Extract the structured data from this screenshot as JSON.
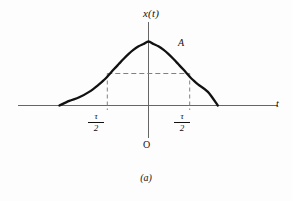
{
  "figure": {
    "caption": "(a)",
    "origin_label": "O",
    "amplitude_label": "A",
    "y_axis_label": "x(t)",
    "x_axis_label": "t",
    "tick_left": {
      "numerator": "τ",
      "denominator": "2"
    },
    "tick_right": {
      "numerator": "τ",
      "denominator": "2"
    },
    "colors": {
      "background": "#fdfdfd",
      "curve": "#111111",
      "axis": "#555555",
      "dashed": "#777777",
      "text": "#111111"
    }
  },
  "chart_data": {
    "type": "line",
    "title": "",
    "subtitle": "",
    "xlabel": "t",
    "ylabel": "x(t)",
    "legend": [],
    "grid": false,
    "xlim": [
      -2.6,
      2.6
    ],
    "ylim": [
      0,
      1.12
    ],
    "annotations": [
      {
        "text": "A",
        "x": 0.55,
        "y": 0.97,
        "note": "peak amplitude label"
      },
      {
        "text": "O",
        "x": 0.0,
        "y": -0.35,
        "note": "origin"
      },
      {
        "text": "τ/2",
        "x": -0.833,
        "y": -0.12,
        "note": "left half-amplitude tick"
      },
      {
        "text": "τ/2",
        "x": 0.833,
        "y": -0.12,
        "note": "right half-amplitude tick"
      }
    ],
    "dashed_guides": [
      {
        "kind": "horizontal",
        "y": 0.5,
        "x_from": -0.833,
        "x_to": 0.833
      },
      {
        "kind": "vertical",
        "x": -0.833,
        "y_from": 0.0,
        "y_to": 0.5
      },
      {
        "kind": "vertical",
        "x": 0.833,
        "y_from": 0.0,
        "y_to": 0.5
      }
    ],
    "series": [
      {
        "name": "x(t)",
        "description": "Gaussian pulse of peak amplitude A, half-amplitude width tau",
        "x": [
          -2.6,
          -2.4,
          -2.2,
          -2.0,
          -1.8,
          -1.6,
          -1.4,
          -1.2,
          -1.0,
          -0.9,
          -0.833,
          -0.7,
          -0.6,
          -0.5,
          -0.4,
          -0.3,
          -0.2,
          -0.1,
          0.0,
          0.1,
          0.2,
          0.3,
          0.4,
          0.5,
          0.6,
          0.7,
          0.833,
          0.9,
          1.0,
          1.2,
          1.4,
          1.6,
          1.8,
          2.0,
          2.2,
          2.4,
          2.6
        ],
        "y": [
          0.002,
          0.004,
          0.009,
          0.019,
          0.038,
          0.072,
          0.128,
          0.213,
          0.33,
          0.398,
          0.45,
          0.565,
          0.648,
          0.73,
          0.806,
          0.872,
          0.925,
          0.962,
          1.0,
          0.962,
          0.925,
          0.872,
          0.806,
          0.73,
          0.648,
          0.565,
          0.45,
          0.398,
          0.33,
          0.213,
          0.128,
          0.072,
          0.038,
          0.019,
          0.009,
          0.004,
          0.002
        ]
      }
    ]
  }
}
